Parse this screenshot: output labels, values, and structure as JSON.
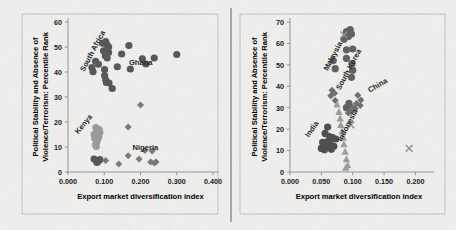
{
  "figure": {
    "name": "two-panel-scatter-figure",
    "background_color": "#f0efed",
    "divider_color": "#6e6e6e"
  },
  "chart_data": [
    {
      "type": "scatter",
      "panel": "left",
      "title": "",
      "xlabel": "Export market diversification index",
      "ylabel": "Political Stability and Absence of Violence/Terrorism: Percentile Rank",
      "xlim": [
        0.0,
        0.4
      ],
      "ylim": [
        0,
        60
      ],
      "xticks": [
        "0.000",
        "0.100",
        "0.200",
        "0.300",
        "0.400"
      ],
      "xtick_values": [
        0.0,
        0.1,
        0.2,
        0.3,
        0.4
      ],
      "yticks": [
        "0",
        "10",
        "20",
        "30",
        "40",
        "50",
        "60"
      ],
      "ytick_values": [
        0,
        10,
        20,
        30,
        40,
        50,
        60
      ],
      "grid": false,
      "legend": "none",
      "annotations": [
        {
          "label": "South Africa",
          "x": 0.045,
          "y": 40,
          "rotation": -62
        },
        {
          "label": "Ghana",
          "x": 0.168,
          "y": 43,
          "rotation": 0
        },
        {
          "label": "Kenya",
          "x": 0.028,
          "y": 15,
          "rotation": -50
        },
        {
          "label": "Nigeria",
          "x": 0.178,
          "y": 9,
          "rotation": 0
        }
      ],
      "series": [
        {
          "name": "Ghana",
          "marker": "circle",
          "color": "#585858",
          "points": [
            [
              0.095,
              51.5
            ],
            [
              0.104,
              52.2
            ],
            [
              0.108,
              50.8
            ],
            [
              0.112,
              50.0
            ],
            [
              0.098,
              48.5
            ],
            [
              0.112,
              47.8
            ],
            [
              0.103,
              46.5
            ],
            [
              0.108,
              45.6
            ],
            [
              0.168,
              50.6
            ],
            [
              0.148,
              47.2
            ],
            [
              0.205,
              45.3
            ],
            [
              0.238,
              45.6
            ],
            [
              0.3,
              47.0
            ],
            [
              0.136,
              42.1
            ],
            [
              0.172,
              41.2
            ],
            [
              0.215,
              43.2
            ],
            [
              0.076,
              44.3
            ],
            [
              0.066,
              41.8
            ],
            [
              0.069,
              40.1
            ],
            [
              0.084,
              43.1
            ],
            [
              0.101,
              41.0
            ],
            [
              0.101,
              38.6
            ],
            [
              0.104,
              36.9
            ],
            [
              0.106,
              35.8
            ],
            [
              0.113,
              35.6
            ],
            [
              0.122,
              33.4
            ]
          ]
        },
        {
          "name": "Kenya",
          "marker": "circle",
          "color": "#9a9a9a",
          "points": [
            [
              0.077,
              17.8
            ],
            [
              0.08,
              16.6
            ],
            [
              0.083,
              15.4
            ],
            [
              0.085,
              14.2
            ],
            [
              0.082,
              13.0
            ],
            [
              0.079,
              12.0
            ],
            [
              0.076,
              11.0
            ],
            [
              0.074,
              13.5
            ],
            [
              0.072,
              15.0
            ],
            [
              0.086,
              17.0
            ],
            [
              0.088,
              15.8
            ],
            [
              0.078,
              10.2
            ]
          ]
        },
        {
          "name": "South Africa cluster low",
          "marker": "circle",
          "color": "#585858",
          "points": [
            [
              0.072,
              5.2
            ],
            [
              0.078,
              4.6
            ],
            [
              0.084,
              4.4
            ],
            [
              0.088,
              5.0
            ],
            [
              0.08,
              3.8
            ]
          ]
        },
        {
          "name": "Nigeria",
          "marker": "diamond",
          "color": "#7a7a7a",
          "points": [
            [
              0.2,
              26.8
            ],
            [
              0.166,
              18.0
            ],
            [
              0.104,
              4.6
            ],
            [
              0.14,
              3.2
            ],
            [
              0.166,
              6.5
            ],
            [
              0.196,
              5.2
            ],
            [
              0.212,
              8.6
            ],
            [
              0.228,
              4.0
            ],
            [
              0.238,
              3.6
            ],
            [
              0.243,
              4.0
            ],
            [
              0.232,
              8.4
            ]
          ]
        }
      ]
    },
    {
      "type": "scatter",
      "panel": "right",
      "title": "",
      "xlabel": "Export market diversification index",
      "ylabel": "Political Stability and Absence of Violence/Terrorism: Percentile Rank",
      "xlim": [
        0.0,
        0.22
      ],
      "ylim": [
        0,
        70
      ],
      "xticks": [
        "0.000",
        "0.050",
        "0.100",
        "0.150",
        "0.200"
      ],
      "xtick_values": [
        0.0,
        0.05,
        0.1,
        0.15,
        0.2
      ],
      "yticks": [
        "0",
        "10",
        "20",
        "30",
        "40",
        "50",
        "60",
        "70"
      ],
      "ytick_values": [
        0,
        10,
        20,
        30,
        40,
        50,
        60,
        70
      ],
      "grid": false,
      "legend": "none",
      "annotations": [
        {
          "label": "Malaysia",
          "x": 0.06,
          "y": 47,
          "rotation": -62
        },
        {
          "label": "South Korea",
          "x": 0.08,
          "y": 38,
          "rotation": -62
        },
        {
          "label": "China",
          "x": 0.127,
          "y": 37,
          "rotation": -30
        },
        {
          "label": "India",
          "x": 0.03,
          "y": 16,
          "rotation": -55
        },
        {
          "label": "Indonesia",
          "x": 0.082,
          "y": 14,
          "rotation": -62
        }
      ],
      "series": [
        {
          "name": "Malaysia",
          "marker": "circle",
          "color": "#616161",
          "points": [
            [
              0.09,
              65.5
            ],
            [
              0.096,
              66.5
            ],
            [
              0.098,
              64.4
            ],
            [
              0.093,
              63.2
            ],
            [
              0.086,
              62.0
            ],
            [
              0.09,
              57.0
            ],
            [
              0.1,
              57.4
            ],
            [
              0.09,
              53.0
            ],
            [
              0.099,
              50.6
            ],
            [
              0.1,
              47.5
            ],
            [
              0.098,
              44.2
            ],
            [
              0.069,
              52.0
            ],
            [
              0.072,
              48.2
            ],
            [
              0.094,
              32.0
            ],
            [
              0.09,
              30.0
            ],
            [
              0.096,
              28.5
            ]
          ]
        },
        {
          "name": "South Korea",
          "marker": "diamond",
          "color": "#6f6f6f",
          "points": [
            [
              0.067,
              38.2
            ],
            [
              0.071,
              36.8
            ],
            [
              0.065,
              35.6
            ],
            [
              0.072,
              33.4
            ],
            [
              0.108,
              35.8
            ],
            [
              0.113,
              33.6
            ],
            [
              0.106,
              32.0
            ],
            [
              0.112,
              31.0
            ],
            [
              0.1,
              30.2
            ],
            [
              0.097,
              28.8
            ],
            [
              0.093,
              27.5
            ],
            [
              0.104,
              29.6
            ]
          ]
        },
        {
          "name": "Indonesia",
          "marker": "triangle",
          "color": "#9d9d9d",
          "points": [
            [
              0.075,
              31.5
            ],
            [
              0.078,
              28.0
            ],
            [
              0.08,
              25.0
            ],
            [
              0.081,
              22.0
            ],
            [
              0.083,
              19.0
            ],
            [
              0.085,
              16.0
            ],
            [
              0.086,
              13.0
            ],
            [
              0.088,
              9.5
            ],
            [
              0.09,
              6.0
            ],
            [
              0.092,
              3.2
            ],
            [
              0.089,
              2.0
            ]
          ]
        },
        {
          "name": "India",
          "marker": "circle",
          "color": "#4f4f4f",
          "points": [
            [
              0.06,
              21.0
            ],
            [
              0.056,
              18.0
            ],
            [
              0.063,
              16.5
            ],
            [
              0.068,
              16.0
            ],
            [
              0.073,
              15.4
            ],
            [
              0.058,
              14.0
            ],
            [
              0.054,
              12.6
            ],
            [
              0.06,
              11.6
            ],
            [
              0.055,
              10.4
            ],
            [
              0.05,
              11.0
            ],
            [
              0.064,
              13.2
            ],
            [
              0.07,
              12.0
            ],
            [
              0.052,
              13.8
            ],
            [
              0.066,
              10.6
            ]
          ]
        },
        {
          "name": "China",
          "marker": "x",
          "color": "#8f8f8f",
          "points": [
            [
              0.086,
              64.0
            ],
            [
              0.097,
              22.0
            ],
            [
              0.19,
              11.0
            ]
          ]
        }
      ]
    }
  ]
}
